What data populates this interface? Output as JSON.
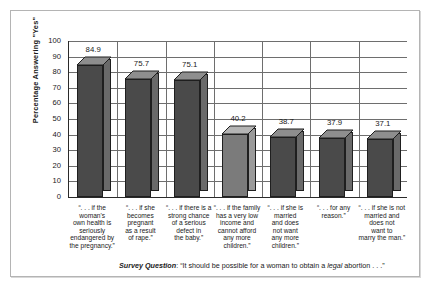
{
  "chart_data": {
    "type": "bar",
    "title": "",
    "subtitle": "",
    "xlabel": "",
    "ylabel": "Percentage Answering \"Yes\"",
    "ylim": [
      0,
      100
    ],
    "ytick_step": 10,
    "ytick_labels": [
      "100",
      "90",
      "80",
      "70",
      "60",
      "50",
      "40",
      "30",
      "20",
      "10",
      "0"
    ],
    "ytick_values": [
      100,
      90,
      80,
      70,
      60,
      50,
      40,
      30,
      20,
      10,
      0
    ],
    "grid": true,
    "legend": "none",
    "categories": [
      "“. . . if the woman's own health is seriously endangered by the pregnancy.”",
      "“. . . if she becomes pregnant as a result of rape.”",
      "“. . . if there is a strong chance of a serious defect in the baby.”",
      "“. . . if the family has a very low income and cannot afford any more children.”",
      "“. . . if she is married and does not want any more children.”",
      "“. . . for any reason.”",
      "“. . . if she is not married and does not want to marry the man.”"
    ],
    "category_lines": [
      [
        "“. . . if the",
        "woman's",
        "own health is",
        "seriously",
        "endangered by",
        "the pregnancy.”"
      ],
      [
        "“. . . if she",
        "becomes",
        "pregnant",
        "as a result",
        "of rape.”"
      ],
      [
        "“. . . if there is a",
        "strong chance",
        "of a serious",
        "defect in",
        "the baby.”"
      ],
      [
        "“. . . if the family",
        "has a very low",
        "income and",
        "cannot afford",
        "any more",
        "children.”"
      ],
      [
        "“. . . if she is",
        "married",
        "and does",
        "not want",
        "any more",
        "children.”"
      ],
      [
        "“. . . for any",
        "reason.”"
      ],
      [
        "“. . . if she is not",
        "married and",
        "does not",
        "want to",
        "marry the man.”"
      ]
    ],
    "values": [
      84.9,
      75.7,
      75.1,
      40.2,
      38.7,
      37.9,
      37.1
    ],
    "value_labels": [
      "84.9",
      "75.7",
      "75.1",
      "40.2",
      "38.7",
      "37.9",
      "37.1"
    ],
    "bar_colors": [
      "#4a4a4a",
      "#4a4a4a",
      "#4a4a4a",
      "#7b7b7b",
      "#4a4a4a",
      "#4a4a4a",
      "#4a4a4a"
    ],
    "bar_side_colors": [
      "#6a6a6a",
      "#6a6a6a",
      "#6a6a6a",
      "#9a9a9a",
      "#6a6a6a",
      "#6a6a6a",
      "#6a6a6a"
    ],
    "bar_top_colors": [
      "#8e8e8e",
      "#8e8e8e",
      "#8e8e8e",
      "#b4b4b4",
      "#8e8e8e",
      "#8e8e8e",
      "#8e8e8e"
    ]
  },
  "caption": {
    "prefix": "Survey Question",
    "separator": ": ",
    "text_before": "“It should be possible for a woman to obtain a ",
    "emphasis": "legal",
    "text_after": " abortion . . .”"
  },
  "colors": {
    "axis": "#2a2a2a",
    "grid": "#6e6e6e",
    "frame": "#b4b4b4",
    "text": "#1a1a1a",
    "background": "#ffffff"
  }
}
